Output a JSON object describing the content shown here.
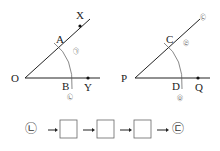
{
  "figure_left": {
    "vertex": "O",
    "ray_upper_point": "X",
    "ray_lower_point": "Y",
    "arc_upper": "A",
    "arc_lower": "B",
    "mark_upper": "㉠",
    "mark_lower": "㉡"
  },
  "figure_right": {
    "vertex": "P",
    "ray_lower_point": "Q",
    "arc_upper": "C",
    "arc_lower": "D",
    "mark_top": "㉢",
    "mark_upper": "㉣",
    "mark_lower": "㉤"
  },
  "sequence": {
    "start": "㉡",
    "end": "㉢",
    "blanks": 3,
    "arrow": "→"
  }
}
